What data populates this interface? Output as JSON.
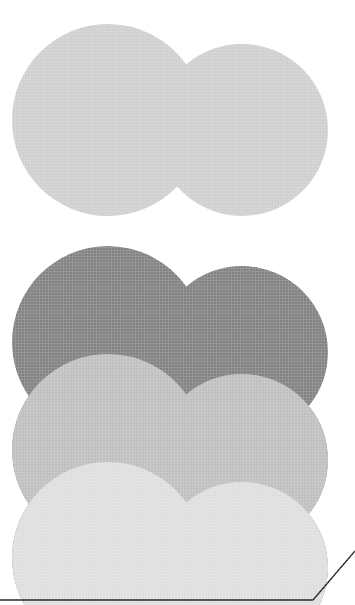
{
  "artwork": {
    "title": "Stacked Overlapping Cloud Shapes",
    "canvas": {
      "width": 355,
      "height": 605,
      "background": "#ffffff"
    },
    "description": "Four vertically stacked peanut-shaped forms, each composed of two overlapping circles, rendered in four values of gray; a thin black rule runs along the bottom edge and a diagonal fold line crosses the lower-right corner.",
    "shape": {
      "name": "peanut-cloud",
      "left_circle": {
        "cx": 108,
        "cy": 120,
        "r": 96
      },
      "right_circle": {
        "cx": 242,
        "cy": 130,
        "r": 86
      },
      "left_extent": 12,
      "right_extent": 322,
      "top_extent": 36,
      "bottom_extent": 553
    },
    "bands": [
      {
        "id": "band-1",
        "label": "Top band",
        "color": "#cfcfcf",
        "y_top": 0,
        "y_bottom": 222
      },
      {
        "id": "band-2",
        "label": "Dark band",
        "color": "#828282",
        "y_top": 222,
        "y_bottom": 330
      },
      {
        "id": "band-3",
        "label": "Mid band",
        "color": "#bfbfbf",
        "y_top": 330,
        "y_bottom": 438
      },
      {
        "id": "band-4",
        "label": "Bottom band",
        "color": "#dedede",
        "y_top": 438,
        "y_bottom": 605
      }
    ],
    "wave_offsets": [
      222,
      330,
      438
    ],
    "rules": {
      "baseline": {
        "label": "bottom-rule",
        "color": "#1c1c1c",
        "y": 600,
        "x_start": 0,
        "x_end": 313,
        "thickness": 1.4
      },
      "fold": {
        "label": "corner-fold-line",
        "color": "#1c1c1c",
        "x1": 313,
        "y1": 600,
        "x2": 355,
        "y2": 551,
        "thickness": 1.4
      }
    }
  }
}
